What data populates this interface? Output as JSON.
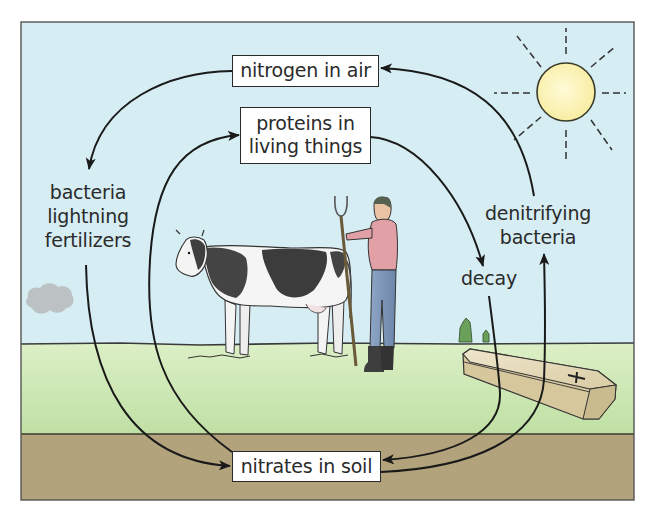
{
  "diagram": {
    "boxes": {
      "air": "nitrogen in air",
      "proteins_line1": "proteins in",
      "proteins_line2": "living things",
      "soil": "nitrates in soil"
    },
    "labels": {
      "fixation_line1": "bacteria",
      "fixation_line2": "lightning",
      "fixation_line3": "fertilizers",
      "denitrify_line1": "denitrifying",
      "denitrify_line2": "bacteria",
      "decay": "decay"
    },
    "illustrations": [
      "sun-icon",
      "cloud-icon",
      "cow-illustration",
      "farmer-illustration",
      "pitchfork-illustration",
      "coffin-illustration",
      "trees-illustration"
    ],
    "colors": {
      "sky": "#d6edf3",
      "grass": "#cfe8b4",
      "soil": "#b3a37d",
      "sun": "#fbf4b8",
      "arrow": "#1a1a1a"
    }
  }
}
